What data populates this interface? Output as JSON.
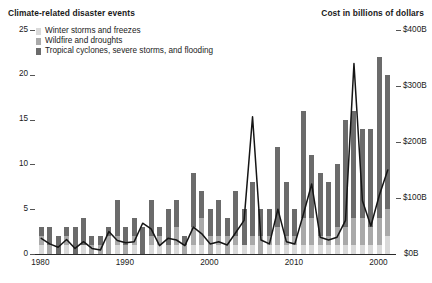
{
  "titles": {
    "left": "Climate-related disaster events",
    "right": "Cost in billions of dollars"
  },
  "legend": {
    "items": [
      {
        "label": "Winter storms and freezes",
        "color": "#d9d9d9",
        "key": "winter"
      },
      {
        "label": "Wildfire and droughts",
        "color": "#a9a9a9",
        "key": "wildfire"
      },
      {
        "label": "Tropical cyclones, severe storms, and flooding",
        "color": "#6b6b6b",
        "key": "tropical"
      }
    ]
  },
  "axes": {
    "left_ticks": [
      "0",
      "5",
      "10",
      "15",
      "20",
      "25"
    ],
    "right_ticks": [
      "$0B",
      "$100B",
      "$200B",
      "$300B",
      "$400B"
    ],
    "x_ticks": [
      {
        "label": "1980",
        "year": 1980
      },
      {
        "label": "1990",
        "year": 1990
      },
      {
        "label": "2000",
        "year": 2000
      },
      {
        "label": "2010",
        "year": 2010
      },
      {
        "label": "2000",
        "year": 2020
      }
    ]
  },
  "chart_data": {
    "type": "bar",
    "title": "Climate-related disaster events",
    "xlabel": "",
    "ylabel": "Number of events",
    "y2label": "Cost in billions of dollars",
    "ylim": [
      0,
      25
    ],
    "y2lim": [
      0,
      400
    ],
    "grid": false,
    "legend_position": "top-left",
    "stacked": true,
    "x": [
      1980,
      1981,
      1982,
      1983,
      1984,
      1985,
      1986,
      1987,
      1988,
      1989,
      1990,
      1991,
      1992,
      1993,
      1994,
      1995,
      1996,
      1997,
      1998,
      1999,
      2000,
      2001,
      2002,
      2003,
      2004,
      2005,
      2006,
      2007,
      2008,
      2009,
      2010,
      2011,
      2012,
      2013,
      2014,
      2015,
      2016,
      2017,
      2018,
      2019,
      2020,
      2021
    ],
    "series": [
      {
        "name": "Winter storms and freezes",
        "color": "#d9d9d9",
        "values": [
          1,
          0,
          0,
          1,
          0,
          1,
          0,
          0,
          0,
          1,
          0,
          1,
          0,
          1,
          1,
          0,
          1,
          0,
          1,
          1,
          0,
          1,
          0,
          1,
          1,
          1,
          0,
          1,
          1,
          1,
          1,
          1,
          1,
          1,
          1,
          1,
          1,
          1,
          1,
          1,
          1,
          2
        ]
      },
      {
        "name": "Wildfire and droughts",
        "color": "#a9a9a9",
        "values": [
          1,
          1,
          0,
          1,
          0,
          0,
          1,
          1,
          2,
          1,
          1,
          1,
          0,
          1,
          1,
          1,
          2,
          1,
          2,
          3,
          2,
          1,
          2,
          1,
          0,
          1,
          2,
          1,
          2,
          1,
          1,
          3,
          3,
          1,
          1,
          2,
          2,
          3,
          3,
          2,
          3,
          3
        ]
      },
      {
        "name": "Tropical cyclones, severe storms, and flooding",
        "color": "#6b6b6b",
        "values": [
          1,
          2,
          2,
          1,
          3,
          3,
          1,
          1,
          1,
          4,
          2,
          2,
          3,
          4,
          1,
          4,
          3,
          1,
          6,
          3,
          3,
          4,
          2,
          5,
          4,
          6,
          3,
          3,
          9,
          6,
          3,
          12,
          7,
          7,
          6,
          7,
          12,
          12,
          10,
          11,
          18,
          15
        ]
      }
    ],
    "line_series": {
      "name": "Cost in billions of dollars",
      "color": "#151515",
      "axis": "right",
      "values": [
        28,
        18,
        12,
        26,
        10,
        22,
        10,
        7,
        40,
        24,
        20,
        22,
        55,
        45,
        15,
        28,
        25,
        15,
        48,
        36,
        18,
        22,
        16,
        38,
        60,
        245,
        25,
        18,
        80,
        22,
        18,
        70,
        125,
        30,
        25,
        30,
        60,
        340,
        95,
        50,
        105,
        150
      ]
    }
  }
}
